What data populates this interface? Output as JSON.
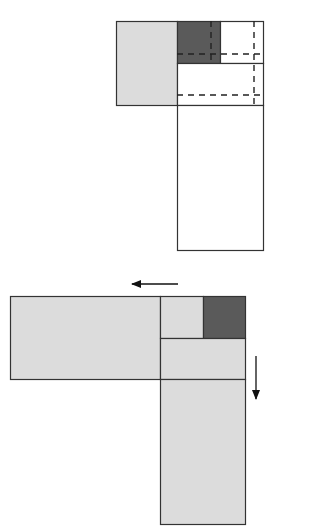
{
  "diagram": {
    "colors": {
      "light_gray": "#dcdcdc",
      "dark_gray": "#5a5a5a",
      "white": "#ffffff",
      "stroke": "#333333"
    },
    "top_panel": {
      "blocks": [
        {
          "name": "left-gray-block",
          "x": 116,
          "y": 21,
          "w": 61,
          "h": 84,
          "fill": "light_gray"
        },
        {
          "name": "dark-corner-block",
          "x": 177,
          "y": 21,
          "w": 43,
          "h": 42,
          "fill": "dark_gray"
        },
        {
          "name": "top-right-white-block",
          "x": 220,
          "y": 21,
          "w": 43,
          "h": 42,
          "fill": "white"
        },
        {
          "name": "middle-white-block",
          "x": 177,
          "y": 63,
          "w": 86,
          "h": 42,
          "fill": "white"
        },
        {
          "name": "tall-white-block",
          "x": 177,
          "y": 105,
          "w": 86,
          "h": 145,
          "fill": "white"
        }
      ],
      "dashed_lines": [
        {
          "name": "dashed-vertical-1",
          "x1": 211,
          "y1": 21,
          "x2": 211,
          "y2": 63
        },
        {
          "name": "dashed-vertical-2",
          "x1": 254,
          "y1": 21,
          "x2": 254,
          "y2": 105
        },
        {
          "name": "dashed-horizontal-1",
          "x1": 177,
          "y1": 54,
          "x2": 263,
          "y2": 54
        },
        {
          "name": "dashed-horizontal-2",
          "x1": 177,
          "y1": 95,
          "x2": 263,
          "y2": 95
        }
      ]
    },
    "bottom_panel": {
      "blocks": [
        {
          "name": "wide-left-gray-block",
          "x": 10,
          "y": 296,
          "w": 150,
          "h": 83,
          "fill": "light_gray"
        },
        {
          "name": "small-gray-block",
          "x": 160,
          "y": 296,
          "w": 43,
          "h": 42,
          "fill": "light_gray"
        },
        {
          "name": "dark-corner-block",
          "x": 203,
          "y": 296,
          "w": 42,
          "h": 42,
          "fill": "dark_gray"
        },
        {
          "name": "middle-gray-block",
          "x": 160,
          "y": 338,
          "w": 85,
          "h": 41,
          "fill": "light_gray"
        },
        {
          "name": "tall-bottom-gray-block",
          "x": 160,
          "y": 379,
          "w": 85,
          "h": 145,
          "fill": "light_gray"
        }
      ],
      "arrows": [
        {
          "name": "left-arrow",
          "direction": "left",
          "x1": 178,
          "y1": 284,
          "x2": 132,
          "y2": 284
        },
        {
          "name": "down-arrow",
          "direction": "down",
          "x1": 256,
          "y1": 356,
          "x2": 256,
          "y2": 399
        }
      ]
    }
  }
}
